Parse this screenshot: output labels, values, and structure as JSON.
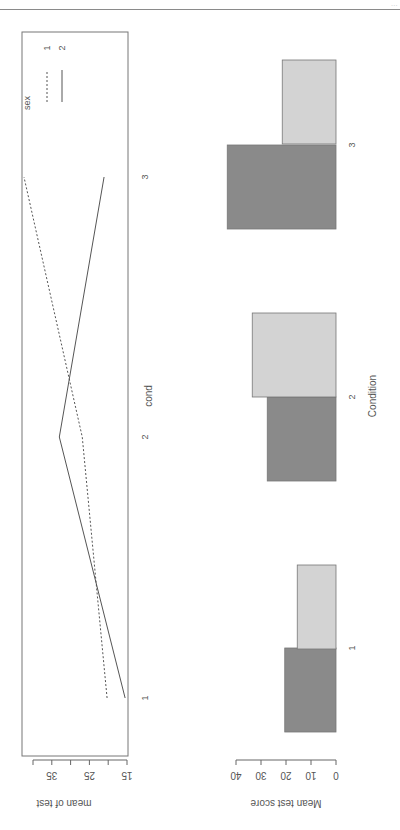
{
  "page": {
    "header_text": "..."
  },
  "chart_data": [
    {
      "type": "line",
      "title": "",
      "xlabel": "cond",
      "ylabel": "mean of test",
      "categories": [
        "1",
        "2",
        "3"
      ],
      "series": [
        {
          "name": "1",
          "style": "dashed",
          "values": [
            20.3,
            26.9,
            42.4
          ]
        },
        {
          "name": "2",
          "style": "solid",
          "values": [
            15.5,
            33.0,
            21.1
          ]
        }
      ],
      "yticks": [
        15,
        20,
        25,
        30,
        35,
        40
      ],
      "ytick_labels": [
        "15",
        "25",
        "35"
      ],
      "ylim": [
        15,
        40
      ],
      "legend": {
        "title": "sex",
        "entries": [
          "1",
          "2"
        ],
        "position": "top-right"
      },
      "grid": false
    },
    {
      "type": "bar",
      "title": "",
      "xlabel": "Condition",
      "ylabel": "Mean test score",
      "categories": [
        "1",
        "2",
        "3"
      ],
      "series": [
        {
          "name": "1",
          "color": "#8a8a8a",
          "values": [
            20.5,
            27.5,
            43.5
          ]
        },
        {
          "name": "2",
          "color": "#d3d3d3",
          "values": [
            15.5,
            33.5,
            21.5
          ]
        }
      ],
      "yticks": [
        0,
        10,
        20,
        30,
        40
      ],
      "ytick_labels": [
        "0",
        "10",
        "20",
        "30",
        "40"
      ],
      "ylim": [
        0,
        40
      ],
      "grid": false
    }
  ]
}
